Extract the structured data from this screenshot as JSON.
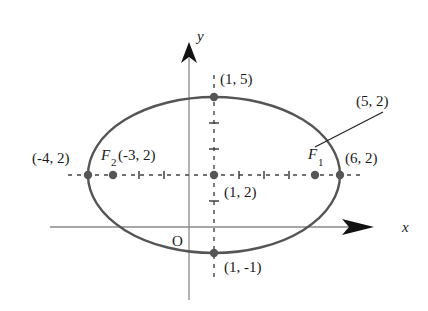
{
  "figure": {
    "type": "ellipse-diagram",
    "axes": {
      "x_label": "x",
      "y_label": "y",
      "origin_label": "O"
    },
    "ellipse": {
      "center": "(1, 2)",
      "vertices": [
        "(-4, 2)",
        "(6, 2)"
      ],
      "co_vertices": [
        "(1, 5)",
        "(1, -1)"
      ],
      "foci": [
        {
          "name": "F",
          "subscript": "1",
          "coords": "(5, 2)"
        },
        {
          "name": "F",
          "subscript": "2",
          "coords": "(-3, 2)"
        }
      ]
    },
    "labels": {
      "top": "(1, 5)",
      "bottom": "(1, -1)",
      "center": "(1, 2)",
      "left_vertex": "(-4, 2)",
      "right_vertex": "(6, 2)",
      "f1_coords": "(5, 2)",
      "f2_coords": "(-3, 2)",
      "f1_name": "F",
      "f1_sub": "1",
      "f2_name": "F",
      "f2_sub": "2"
    },
    "colors": {
      "ellipse": "#555555",
      "axis": "#888888",
      "points": "#555555",
      "dashed": "#444444"
    }
  }
}
